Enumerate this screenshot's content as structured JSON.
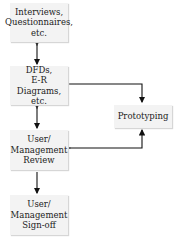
{
  "diagram": {
    "nodes": [
      {
        "id": "interviews",
        "lines": [
          "Interviews,",
          "Questionnaires,",
          "etc."
        ]
      },
      {
        "id": "dfds",
        "lines": [
          "DFDs,",
          "E-R Diagrams,",
          "etc."
        ]
      },
      {
        "id": "review",
        "lines": [
          "User/",
          "Management",
          "Review"
        ]
      },
      {
        "id": "signoff",
        "lines": [
          "User/",
          "Management",
          "Sign-off"
        ]
      },
      {
        "id": "prototyping",
        "lines": [
          "Prototyping"
        ]
      }
    ],
    "edges": [
      {
        "from": "interviews",
        "to": "dfds",
        "bidirectional": true
      },
      {
        "from": "dfds",
        "to": "review",
        "bidirectional": true
      },
      {
        "from": "dfds",
        "to": "prototyping",
        "bidirectional": false
      },
      {
        "from": "review",
        "to": "prototyping",
        "bidirectional": true
      },
      {
        "from": "review",
        "to": "signoff",
        "bidirectional": false
      }
    ]
  }
}
